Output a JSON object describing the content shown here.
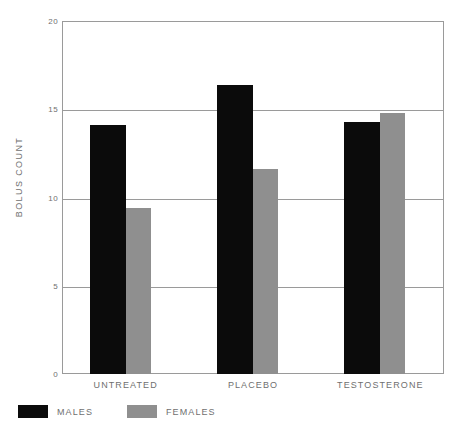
{
  "chart_data": {
    "type": "bar",
    "title": "",
    "xlabel": "",
    "ylabel": "BOLUS COUNT",
    "ylim": [
      0,
      20
    ],
    "yticks": [
      0,
      5,
      10,
      15,
      20
    ],
    "ytick_labels": [
      "0",
      "5",
      "10",
      "15",
      "20"
    ],
    "grid": true,
    "legend_position": "bottom-left",
    "categories": [
      "UNTREATED",
      "PLACEBO",
      "TESTOSTERONE"
    ],
    "series": [
      {
        "name": "MALES",
        "color": "#0b0b0b",
        "values": [
          14.1,
          16.4,
          14.3
        ]
      },
      {
        "name": "FEMALES",
        "color": "#8f8f8f",
        "values": [
          9.4,
          11.6,
          14.8
        ]
      }
    ]
  },
  "axis": {
    "frame_color": "#9a9a9a",
    "label_color": "#6f6f6f"
  }
}
